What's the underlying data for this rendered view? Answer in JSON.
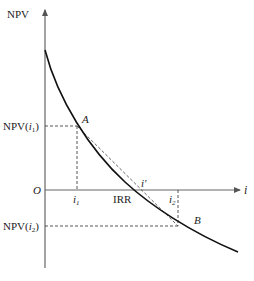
{
  "diagram": {
    "type": "npv-irr-linear-interpolation",
    "y_axis_label": "NPV",
    "x_axis_label": "i",
    "origin_label": "O",
    "points": {
      "A": {
        "label": "A",
        "x_label": "i",
        "x_sub": "1",
        "y_label": "NPV(",
        "y_arg": "i",
        "y_sub": "1",
        "y_close": ")"
      },
      "B": {
        "label": "B",
        "x_label": "i",
        "x_sub": "2",
        "y_label": "NPV(",
        "y_arg": "i",
        "y_sub": "2",
        "y_close": ")"
      }
    },
    "irr_label": "IRR",
    "i_prime_label": "i′",
    "colors": {
      "curve": "#111111",
      "axis": "#555555",
      "dashed": "#444444"
    }
  }
}
